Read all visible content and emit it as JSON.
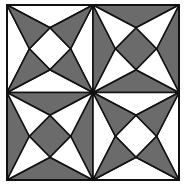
{
  "figure": {
    "colors": {
      "fill": "#6b6b6b",
      "background": "#ffffff",
      "stroke": "#111111"
    },
    "bounds": {
      "x": 7,
      "y": 5,
      "width": 172,
      "height": 175
    },
    "tiles": [
      {
        "position": "top-left",
        "mode": "corners-shaded"
      },
      {
        "position": "top-right",
        "mode": "edges-and-center-shaded"
      },
      {
        "position": "bottom-left",
        "mode": "edges-and-center-shaded"
      },
      {
        "position": "bottom-right",
        "mode": "corners-shaded"
      }
    ]
  }
}
